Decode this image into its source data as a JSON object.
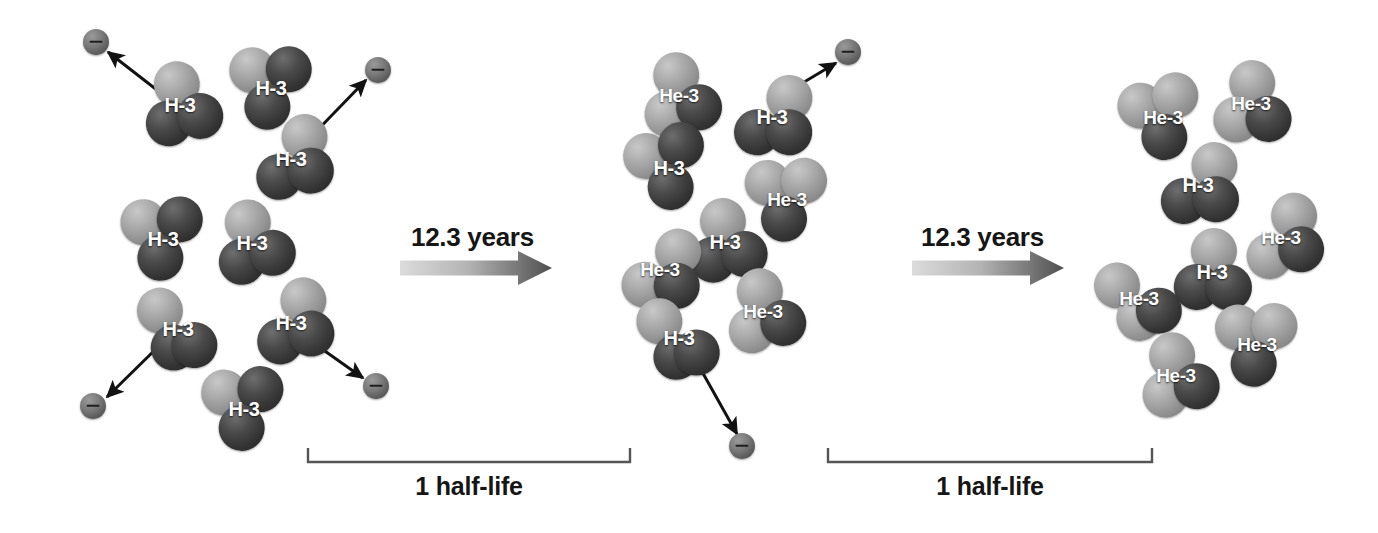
{
  "figure": {
    "background_color": "#ffffff"
  },
  "labels": {
    "h3": "H-3",
    "he3": "He-3",
    "electron_sign": "minus-sign",
    "transition_1_label": "12.3 years",
    "transition_2_label": "12.3 years",
    "bracket_1_label": "1 half-life",
    "bracket_2_label": "1 half-life"
  },
  "colors": {
    "nucleon_dark": "#3a3a3a",
    "nucleon_light": "#a0a0a0",
    "electron": "#6b6b6b",
    "text": "#161616",
    "arrow_gradient_start": "#d8d8d8",
    "arrow_gradient_end": "#4a4a4a",
    "bracket": "#555555"
  },
  "panels": [
    {
      "name": "stage-0-initial",
      "h3_count": 8,
      "he3_count": 0,
      "nuclei": [
        {
          "kind": "H-3",
          "label": "H-3",
          "x": 180,
          "y": 105,
          "rot": -6,
          "variant": "a"
        },
        {
          "kind": "H-3",
          "label": "H-3",
          "x": 271,
          "y": 88,
          "rot": 8,
          "variant": "b"
        },
        {
          "kind": "H-3",
          "label": "H-3",
          "x": 291,
          "y": 159,
          "rot": -4,
          "variant": "c"
        },
        {
          "kind": "H-3",
          "label": "H-3",
          "x": 163,
          "y": 239,
          "rot": 5,
          "variant": "b"
        },
        {
          "kind": "H-3",
          "label": "H-3",
          "x": 252,
          "y": 243,
          "rot": -9,
          "variant": "a"
        },
        {
          "kind": "H-3",
          "label": "H-3",
          "x": 178,
          "y": 329,
          "rot": 10,
          "variant": "d"
        },
        {
          "kind": "H-3",
          "label": "H-3",
          "x": 291,
          "y": 323,
          "rot": -7,
          "variant": "c"
        },
        {
          "kind": "H-3",
          "label": "H-3",
          "x": 244,
          "y": 409,
          "rot": 4,
          "variant": "b"
        }
      ],
      "electrons": [
        {
          "x": 96,
          "y": 42
        },
        {
          "x": 378,
          "y": 70
        },
        {
          "x": 93,
          "y": 406
        },
        {
          "x": 376,
          "y": 386
        }
      ],
      "emission_arrows": [
        {
          "x1": 166,
          "y1": 97,
          "x2": 108,
          "y2": 52
        },
        {
          "x1": 305,
          "y1": 143,
          "x2": 366,
          "y2": 80
        },
        {
          "x1": 164,
          "y1": 341,
          "x2": 107,
          "y2": 397
        },
        {
          "x1": 305,
          "y1": 337,
          "x2": 363,
          "y2": 378
        }
      ]
    },
    {
      "name": "stage-1-one-halflife",
      "h3_count": 4,
      "he3_count": 4,
      "nuclei": [
        {
          "kind": "He-3",
          "label": "He-3",
          "x": 679,
          "y": 96,
          "rot": -5,
          "variant": "a"
        },
        {
          "kind": "H-3",
          "label": "H-3",
          "x": 772,
          "y": 117,
          "rot": 7,
          "variant": "c"
        },
        {
          "kind": "H-3",
          "label": "H-3",
          "x": 669,
          "y": 168,
          "rot": -8,
          "variant": "b"
        },
        {
          "kind": "He-3",
          "label": "He-3",
          "x": 787,
          "y": 200,
          "rot": 6,
          "variant": "b"
        },
        {
          "kind": "H-3",
          "label": "H-3",
          "x": 725,
          "y": 242,
          "rot": -3,
          "variant": "a"
        },
        {
          "kind": "He-3",
          "label": "He-3",
          "x": 660,
          "y": 270,
          "rot": 9,
          "variant": "c"
        },
        {
          "kind": "He-3",
          "label": "He-3",
          "x": 763,
          "y": 312,
          "rot": -6,
          "variant": "a"
        },
        {
          "kind": "H-3",
          "label": "H-3",
          "x": 679,
          "y": 338,
          "rot": 5,
          "variant": "d"
        }
      ],
      "electrons": [
        {
          "x": 848,
          "y": 52
        },
        {
          "x": 742,
          "y": 446
        }
      ],
      "emission_arrows": [
        {
          "x1": 774,
          "y1": 100,
          "x2": 836,
          "y2": 63
        },
        {
          "x1": 700,
          "y1": 368,
          "x2": 737,
          "y2": 434
        }
      ]
    },
    {
      "name": "stage-2-two-halflives",
      "h3_count": 2,
      "he3_count": 6,
      "nuclei": [
        {
          "kind": "He-3",
          "label": "He-3",
          "x": 1163,
          "y": 118,
          "rot": -7,
          "variant": "b"
        },
        {
          "kind": "He-3",
          "label": "He-3",
          "x": 1251,
          "y": 104,
          "rot": 6,
          "variant": "a"
        },
        {
          "kind": "H-3",
          "label": "H-3",
          "x": 1198,
          "y": 185,
          "rot": 4,
          "variant": "c"
        },
        {
          "kind": "He-3",
          "label": "He-3",
          "x": 1281,
          "y": 238,
          "rot": -5,
          "variant": "c"
        },
        {
          "kind": "H-3",
          "label": "H-3",
          "x": 1212,
          "y": 272,
          "rot": 8,
          "variant": "a"
        },
        {
          "kind": "He-3",
          "label": "He-3",
          "x": 1139,
          "y": 299,
          "rot": -4,
          "variant": "d"
        },
        {
          "kind": "He-3",
          "label": "He-3",
          "x": 1257,
          "y": 345,
          "rot": 7,
          "variant": "b"
        },
        {
          "kind": "He-3",
          "label": "He-3",
          "x": 1176,
          "y": 376,
          "rot": -8,
          "variant": "a"
        }
      ],
      "electrons": [],
      "emission_arrows": []
    }
  ],
  "transitions": [
    {
      "name": "transition-1",
      "label": "12.3 years",
      "label_x": 411,
      "label_y": 222,
      "arrow_x": 400,
      "arrow_y": 268,
      "arrow_width": 152
    },
    {
      "name": "transition-2",
      "label": "12.3 years",
      "label_x": 921,
      "label_y": 222,
      "arrow_x": 912,
      "arrow_y": 268,
      "arrow_width": 152
    }
  ],
  "brackets": [
    {
      "name": "bracket-1",
      "label": "1 half-life",
      "x1": 308,
      "x2": 630,
      "y": 448,
      "depth": 14,
      "label_x": 469,
      "label_y": 472
    },
    {
      "name": "bracket-2",
      "label": "1 half-life",
      "x1": 828,
      "x2": 1152,
      "y": 448,
      "depth": 14,
      "label_x": 990,
      "label_y": 472
    }
  ]
}
